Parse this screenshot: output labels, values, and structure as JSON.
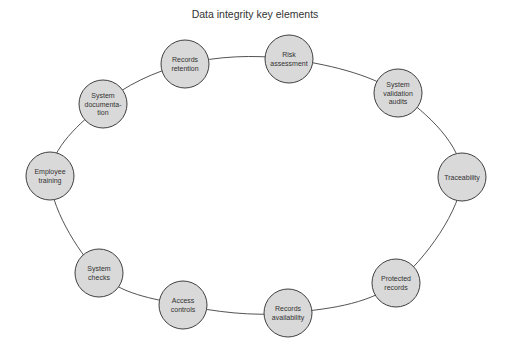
{
  "title": "Data integrity key elements",
  "colors": {
    "node_fill": "#d9d9d9",
    "node_stroke": "#404040",
    "connector": "#404040",
    "text": "#333333",
    "background": "#ffffff"
  },
  "ring": {
    "cx": 256,
    "cy": 186,
    "rx": 210,
    "ry": 126
  },
  "node_radius": 24,
  "nodes": [
    {
      "id": "records-retention",
      "lines": [
        "Records",
        "retention"
      ],
      "x": 185,
      "y": 64
    },
    {
      "id": "risk-assessment",
      "lines": [
        "Risk",
        "assessment"
      ],
      "x": 289,
      "y": 59
    },
    {
      "id": "system-validation-audits",
      "lines": [
        "System",
        "validation",
        "audits"
      ],
      "x": 398,
      "y": 93
    },
    {
      "id": "traceability",
      "lines": [
        "Traceability"
      ],
      "x": 462,
      "y": 177
    },
    {
      "id": "protected-records",
      "lines": [
        "Protected",
        "records"
      ],
      "x": 396,
      "y": 283
    },
    {
      "id": "records-availability",
      "lines": [
        "Records",
        "availability"
      ],
      "x": 288,
      "y": 313
    },
    {
      "id": "access-controls",
      "lines": [
        "Access",
        "controls"
      ],
      "x": 183,
      "y": 305
    },
    {
      "id": "system-checks",
      "lines": [
        "System",
        "checks"
      ],
      "x": 99,
      "y": 273
    },
    {
      "id": "employee-training",
      "lines": [
        "Employee",
        "training"
      ],
      "x": 50,
      "y": 176
    },
    {
      "id": "system-documentation",
      "lines": [
        "System",
        "documenta-",
        "tion"
      ],
      "x": 103,
      "y": 104
    }
  ]
}
